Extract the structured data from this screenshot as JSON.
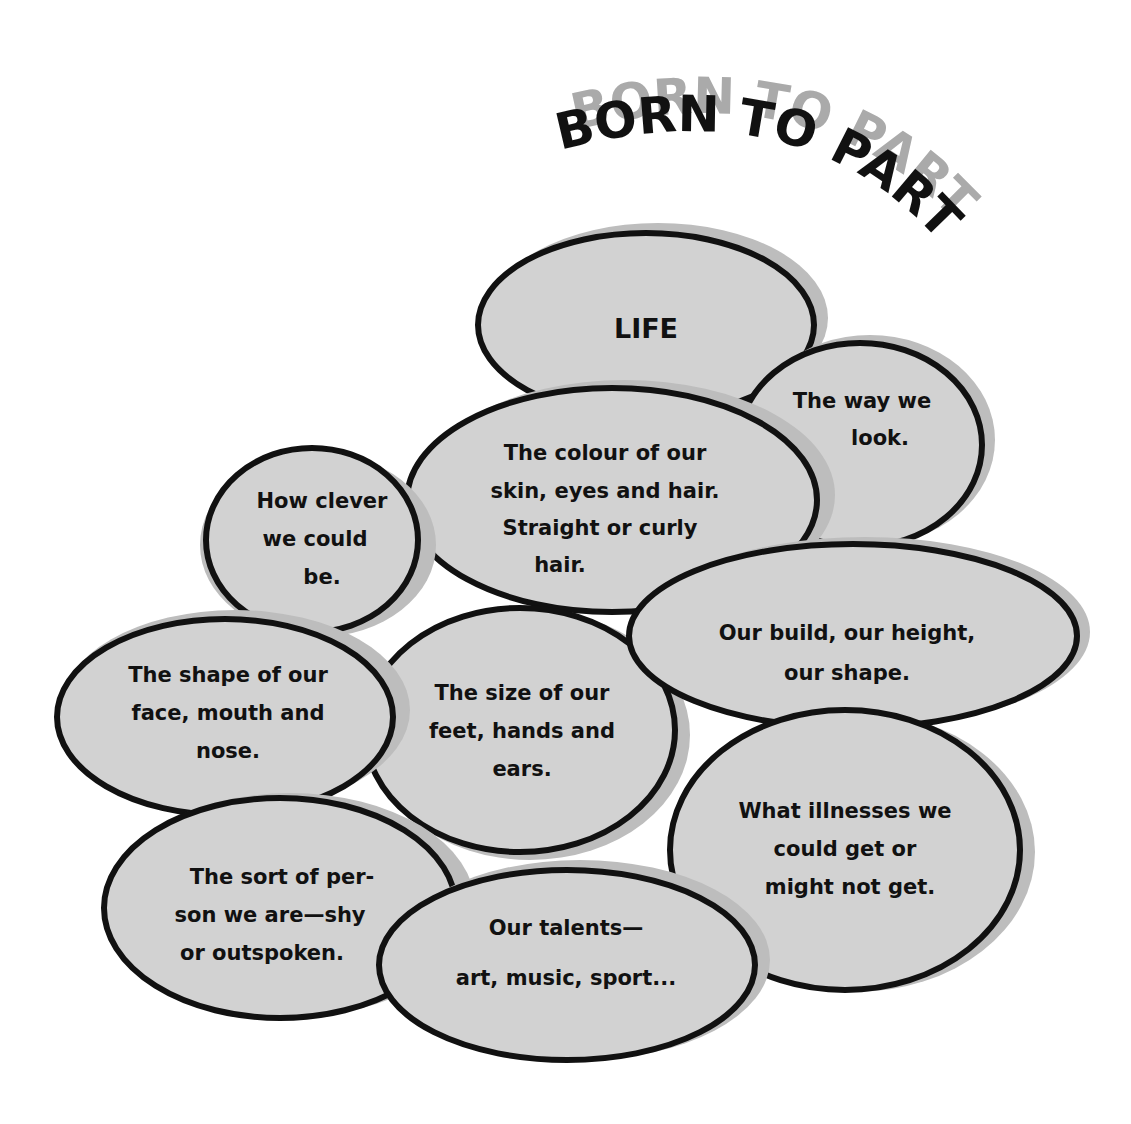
{
  "title": "BORN TO PART",
  "colors": {
    "bubble_fill": "#d2d2d2",
    "bubble_stroke": "#111111",
    "shadow": "#bdbdbd",
    "title_shadow": "#aaaaaa",
    "text": "#111111"
  },
  "bubbles": [
    {
      "id": "life",
      "lines": [
        "LIFE"
      ]
    },
    {
      "id": "way-we-look",
      "lines": [
        "The way we",
        "look."
      ]
    },
    {
      "id": "colour",
      "lines": [
        "The colour of our",
        "skin, eyes and hair.",
        "Straight or curly",
        "hair."
      ]
    },
    {
      "id": "clever",
      "lines": [
        "How clever",
        "we could",
        "be."
      ]
    },
    {
      "id": "build",
      "lines": [
        "Our build, our height,",
        "our shape."
      ]
    },
    {
      "id": "face-shape",
      "lines": [
        "The shape of our",
        "face, mouth  and",
        "nose."
      ]
    },
    {
      "id": "size",
      "lines": [
        "The size of our",
        "feet, hands and",
        "ears."
      ]
    },
    {
      "id": "illnesses",
      "lines": [
        "What illnesses we",
        "could get or",
        "might not get."
      ]
    },
    {
      "id": "sort-of-person",
      "lines": [
        "The sort of per-",
        "son we are—shy",
        "or outspoken."
      ]
    },
    {
      "id": "talents",
      "lines": [
        "Our talents—",
        "art, music, sport..."
      ]
    }
  ]
}
